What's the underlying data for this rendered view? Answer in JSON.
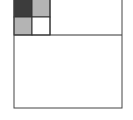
{
  "diagram": {
    "type": "area-subdivision",
    "outer": {
      "x": 14,
      "y": -1,
      "w": 108,
      "h": 109
    },
    "divider_y": 35,
    "top_block_right_x": 50,
    "cells": [
      {
        "name": "cell-top-left",
        "x": 14,
        "y": -1,
        "w": 18,
        "h": 18,
        "fill": "#3c3c3c"
      },
      {
        "name": "cell-top-right",
        "x": 32,
        "y": -1,
        "w": 18,
        "h": 18,
        "fill": "#b4b4b4"
      },
      {
        "name": "cell-bottom-left",
        "x": 14,
        "y": 17,
        "w": 18,
        "h": 18,
        "fill": "#b4b4b4"
      },
      {
        "name": "cell-bottom-right",
        "x": 32,
        "y": 17,
        "w": 18,
        "h": 18,
        "fill": "#ffffff"
      }
    ],
    "stroke": "#333333"
  }
}
